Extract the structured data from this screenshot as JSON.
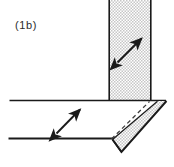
{
  "figure": {
    "label": "(1b)",
    "caption_text": "(1b)",
    "type": "technical-line-drawing",
    "background_color": "#ffffff",
    "line_color": "#1a1a1a",
    "stipple_color": "#b9b9b9",
    "dashed_line_color": "#555555"
  },
  "elements": {
    "vertical_plate": {
      "name": "vertical-stippled-plate",
      "fill": "stipple",
      "x": 108,
      "y": 0,
      "width": 44,
      "height": 101
    },
    "horizontal_plate": {
      "name": "horizontal-perspective-plate",
      "top_line_y": 100,
      "bottom_line_y": 138,
      "left_x": 9,
      "right_x": 166
    },
    "edge_face": {
      "name": "plate-edge-face",
      "fill": "stipple"
    },
    "hidden_edge": {
      "name": "hidden-edge-dashed",
      "style": "dashed",
      "from": [
        112,
        139
      ],
      "to": [
        148,
        102
      ]
    },
    "arrow_vertical_plate": {
      "name": "double-headed-arrow-web",
      "from": [
        117,
        62
      ],
      "to": [
        142,
        38
      ],
      "heads": 2,
      "orientation": "NE-SW"
    },
    "arrow_horizontal_plate": {
      "name": "double-headed-arrow-flange",
      "from": [
        56,
        133
      ],
      "to": [
        80,
        109
      ],
      "heads": 2,
      "orientation": "NE-SW"
    }
  }
}
